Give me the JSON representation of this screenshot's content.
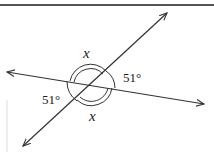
{
  "diagram": {
    "type": "intersecting-lines-angles",
    "labels": {
      "top_angle": "x",
      "bottom_angle": "x",
      "right_angle": "51°",
      "left_angle": "51°"
    },
    "colors": {
      "stroke": "#333333",
      "background": "#ffffff"
    }
  }
}
